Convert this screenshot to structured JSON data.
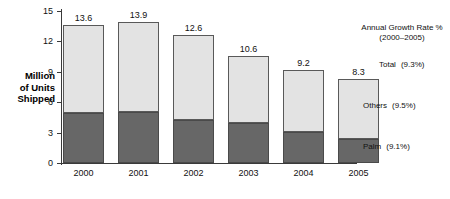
{
  "chart_data": {
    "type": "bar",
    "subtype": "stacked-bar",
    "title": "",
    "xlabel": "",
    "ylabel": "Million of Units Shipped",
    "ylim": [
      0,
      15
    ],
    "yticks": [
      0,
      3,
      6,
      9,
      12,
      15
    ],
    "grid": false,
    "categories": [
      "2000",
      "2001",
      "2002",
      "2003",
      "2004",
      "2005"
    ],
    "series": [
      {
        "name": "Palm",
        "values": [
          4.9,
          5.0,
          4.2,
          3.9,
          3.1,
          2.4
        ]
      },
      {
        "name": "Others",
        "values": [
          8.7,
          8.9,
          8.4,
          6.7,
          6.1,
          5.9
        ]
      }
    ],
    "totals": [
      13.6,
      13.9,
      12.6,
      10.6,
      9.2,
      8.3
    ],
    "data_labels": [
      "13.6",
      "13.9",
      "12.6",
      "10.6",
      "9.2",
      "8.3"
    ],
    "legend_position": "right",
    "annotations": [
      "Annual Growth Rate %",
      "(2000–2005)",
      "Total (9.3%)",
      "Others (9.5%)",
      "Palm (9.1%)"
    ],
    "colors": {
      "palm": "#676767",
      "others": "#e3e3e3",
      "axis": "#3a3a3a"
    }
  },
  "axis": {
    "y_label_lines": [
      "Million",
      "of Units",
      "Shipped"
    ],
    "y_tick_labels": [
      "0",
      "3",
      "6",
      "9",
      "12",
      "15"
    ],
    "x_tick_labels": [
      "2000",
      "2001",
      "2002",
      "2003",
      "2004",
      "2005"
    ]
  },
  "legend": {
    "title_line1": "Annual Growth Rate %",
    "title_line2": "(2000–2005)",
    "entries": [
      {
        "name": "Total",
        "rate": "(9.3%)"
      },
      {
        "name": "Others",
        "rate": "(9.5%)"
      },
      {
        "name": "Palm",
        "rate": "(9.1%)"
      }
    ]
  },
  "bars": [
    {
      "year": "2000",
      "total": "13.6"
    },
    {
      "year": "2001",
      "total": "13.9"
    },
    {
      "year": "2002",
      "total": "12.6"
    },
    {
      "year": "2003",
      "total": "10.6"
    },
    {
      "year": "2004",
      "total": "9.2"
    },
    {
      "year": "2005",
      "total": "8.3"
    }
  ]
}
